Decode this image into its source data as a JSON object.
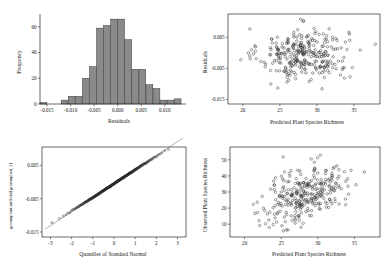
{
  "figure": {
    "panel_count": 4,
    "background": "#ffffff",
    "point_color": "#2b2b2b",
    "bar_fill": "#8a8a8a",
    "bar_edge": "#3a3a3a",
    "refline_color": "#6f6f6f"
  },
  "chart_data": [
    {
      "id": "residual-histogram",
      "type": "bar",
      "title": "",
      "xlabel": "Residuals",
      "ylabel": "Frequency",
      "xlim": [
        -0.0165,
        0.0145
      ],
      "ylim": [
        0,
        70
      ],
      "xticks": [
        -0.015,
        -0.01,
        -0.005,
        0.0,
        0.005,
        0.01
      ],
      "xticklabels": [
        "-0.015",
        "-0.010",
        "-0.005",
        "0.000",
        "0.005",
        "0.010"
      ],
      "yticks": [
        0,
        20,
        40,
        60
      ],
      "yticklabels": [
        "0",
        "20",
        "40",
        "60"
      ],
      "grid": false,
      "bin_width": 0.0015,
      "bin_starts": [
        -0.0165,
        -0.015,
        -0.0135,
        -0.012,
        -0.0105,
        -0.009,
        -0.0075,
        -0.006,
        -0.0045,
        -0.003,
        -0.0015,
        0.0,
        0.0015,
        0.003,
        0.0045,
        0.006,
        0.0075,
        0.009,
        0.0105,
        0.012
      ],
      "categories": [
        "-0.0165",
        "-0.0150",
        "-0.0135",
        "-0.0120",
        "-0.0105",
        "-0.0090",
        "-0.0075",
        "-0.0060",
        "-0.0045",
        "-0.0030",
        "-0.0015",
        "0.0000",
        "0.0015",
        "0.0030",
        "0.0045",
        "0.0060",
        "0.0075",
        "0.0090",
        "0.0105",
        "0.0120"
      ],
      "values": [
        1,
        0,
        0,
        3,
        6,
        6,
        20,
        29,
        59,
        61,
        66,
        66,
        50,
        27,
        27,
        15,
        12,
        3,
        3,
        4
      ]
    },
    {
      "id": "residuals-vs-predicted",
      "type": "scatter",
      "title": "",
      "xlabel": "Predicted Plant Species Richness",
      "ylabel": "Residuals",
      "xlim": [
        18.0,
        38.5
      ],
      "ylim": [
        -0.0165,
        0.0125
      ],
      "xticks": [
        20,
        25,
        30,
        35
      ],
      "xticklabels": [
        "20",
        "25",
        "30",
        "35"
      ],
      "yticks": [
        0.005,
        -0.005,
        -0.015
      ],
      "yticklabels": [
        "0.005",
        "-0.005",
        "-0.015"
      ],
      "grid": false,
      "n_points": 300,
      "x_center": 28.2,
      "x_spread": 3.0,
      "y_center": -0.0005,
      "y_spread": 0.0042,
      "marker": "open-circle",
      "marker_radius": 1.25
    },
    {
      "id": "normal-qq-plot",
      "type": "scatter",
      "title": "",
      "xlabel": "Quantiles of Standard Normal",
      "ylabel": "geomnplant.surftotal[geomnplant, 2]",
      "xlim": [
        -3.4,
        3.4
      ],
      "ylim": [
        -0.0165,
        0.0105
      ],
      "xticks": [
        -3,
        -2,
        -1,
        0,
        1,
        2,
        3
      ],
      "xticklabels": [
        "-3",
        "-2",
        "-1",
        "0",
        "1",
        "2",
        "3"
      ],
      "yticks": [
        0.005,
        -0.005,
        -0.015
      ],
      "yticklabels": [
        "0.005",
        "-0.005",
        "-0.015"
      ],
      "grid": false,
      "n_points": 300,
      "reference_line": {
        "slope": 0.0042,
        "intercept": -0.0005
      },
      "marker": "open-circle",
      "marker_radius": 1.0
    },
    {
      "id": "observed-vs-predicted",
      "type": "scatter",
      "title": "",
      "xlabel": "Predicted Plant Species Richness",
      "ylabel": "Observed Plant Species Richness",
      "xlim": [
        18.0,
        38.5
      ],
      "ylim": [
        2.0,
        58.0
      ],
      "xticks": [
        20,
        25,
        30,
        35
      ],
      "xticklabels": [
        "20",
        "25",
        "30",
        "35"
      ],
      "yticks": [
        10,
        20,
        30,
        40,
        50
      ],
      "yticklabels": [
        "10",
        "20",
        "30",
        "40",
        "50"
      ],
      "grid": false,
      "n_points": 300,
      "x_center": 28.2,
      "x_spread": 3.0,
      "y_center": 28.5,
      "y_spread": 9.5,
      "correlation": 0.45,
      "marker": "open-circle",
      "marker_radius": 1.25
    }
  ]
}
